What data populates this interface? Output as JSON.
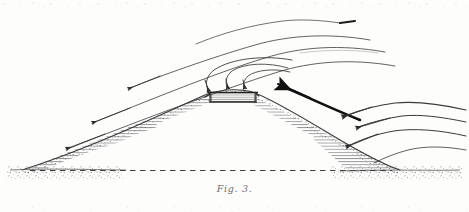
{
  "figure": {
    "caption": "Fig. 3.",
    "background_color": "#fdfdfc",
    "ink_color": "#3a3a3a",
    "hatch_color": "#555555",
    "dashed_line_color": "#4a4a4a",
    "heavy_arrow_color": "#1c1c1c"
  },
  "terrain": {
    "label": "hill-cross-section",
    "baseline_y": 170,
    "summit": {
      "x": 232,
      "y": 93
    },
    "left_toe": {
      "x": 22,
      "y": 170
    },
    "right_toe": {
      "x": 400,
      "y": 170
    },
    "ground_texture": "stippled",
    "fill_pattern": "horizontal-hatching"
  },
  "summit_structure": {
    "label": "summit-building",
    "x": 210,
    "y": 92,
    "width": 46,
    "height": 11,
    "roof_pattern": "hatched"
  },
  "baseline": {
    "label": "reference-ground-level",
    "style": "dashed",
    "from_x": 30,
    "to_x": 392,
    "y": 170
  },
  "streamlines": [
    {
      "name": "upper-crest-line",
      "direction": "right-to-left",
      "weight": "thin",
      "arrow": false
    },
    {
      "name": "lee-streamline-1",
      "direction": "right-to-left",
      "weight": "thin",
      "arrow": true
    },
    {
      "name": "lee-streamline-2",
      "direction": "right-to-left",
      "weight": "thin",
      "arrow": true
    },
    {
      "name": "lee-streamline-3",
      "direction": "right-to-left",
      "weight": "thin",
      "arrow": true
    },
    {
      "name": "eddy-curl-outer",
      "direction": "downward-onto-summit",
      "weight": "thin",
      "arrow": true
    },
    {
      "name": "eddy-curl-middle",
      "direction": "downward-onto-summit",
      "weight": "thin",
      "arrow": true
    },
    {
      "name": "eddy-curl-inner",
      "direction": "downward-onto-summit",
      "weight": "thin",
      "arrow": true
    },
    {
      "name": "windward-slope-flow",
      "direction": "right-to-left-upslope",
      "weight": "heavy",
      "arrow": true
    },
    {
      "name": "windward-lower-1",
      "direction": "right-to-left-upslope",
      "weight": "thin",
      "arrow": true
    },
    {
      "name": "windward-lower-2",
      "direction": "right-to-left-upslope",
      "weight": "thin",
      "arrow": true
    },
    {
      "name": "windward-lower-3",
      "direction": "right-to-left-upslope",
      "weight": "thin",
      "arrow": true
    }
  ]
}
